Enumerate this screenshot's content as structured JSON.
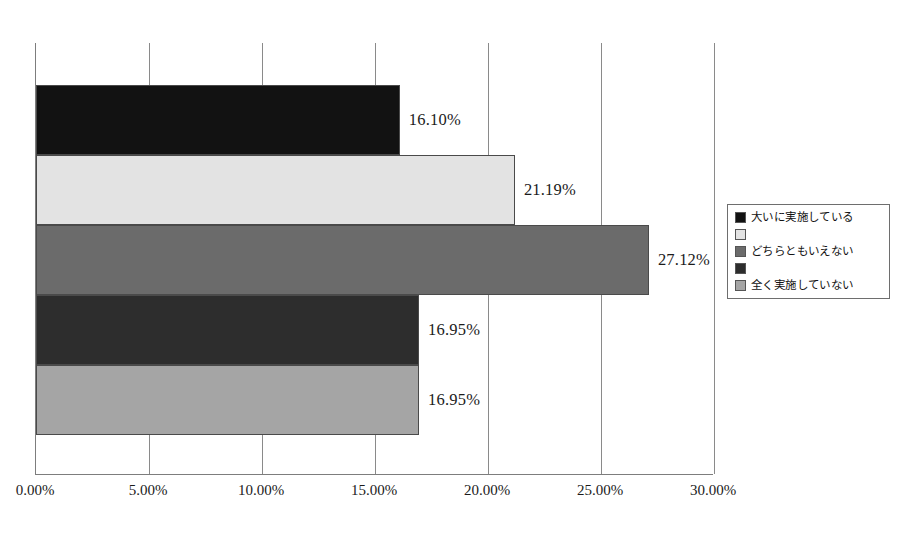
{
  "chart_data": {
    "type": "bar",
    "orientation": "horizontal",
    "title": "",
    "xlabel": "",
    "ylabel": "",
    "xlim": [
      0,
      30
    ],
    "grid": true,
    "legend_position": "right",
    "categories": [
      "大いに実施している",
      "",
      "どちらともいえない",
      "",
      "全く実施していない"
    ],
    "values": [
      16.1,
      21.19,
      27.12,
      16.95,
      16.95
    ],
    "value_labels": [
      "16.10%",
      "21.19%",
      "27.12%",
      "16.95%",
      "16.95%"
    ],
    "bar_colors": [
      "#121212",
      "#e3e3e3",
      "#6b6b6b",
      "#2d2d2d",
      "#a5a5a5"
    ],
    "tick_values": [
      0,
      5,
      10,
      15,
      20,
      25,
      30
    ],
    "tick_labels": [
      "0.00%",
      "5.00%",
      "10.00%",
      "15.00%",
      "20.00%",
      "25.00%",
      "30.00%"
    ]
  },
  "legend": {
    "items": [
      {
        "label": "大いに実施している",
        "color": "#121212"
      },
      {
        "label": "",
        "color": "#e3e3e3"
      },
      {
        "label": "どちらともいえない",
        "color": "#6b6b6b"
      },
      {
        "label": "",
        "color": "#2d2d2d"
      },
      {
        "label": "全く実施していない",
        "color": "#a5a5a5"
      }
    ]
  },
  "colors": {
    "axis": "#7d7d7d",
    "gridline": "#8a8a8a",
    "text": "#1b1b1b",
    "background": "#ffffff"
  }
}
